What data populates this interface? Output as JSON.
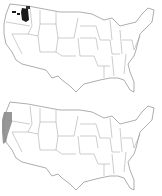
{
  "figure": {
    "panels": [
      {
        "id": "top",
        "description": "US state map with dark shaded region in eastern Washington / northern Idaho",
        "highlight_color": "#1a1a1a",
        "highlighted_regions": [
          "eastern-washington",
          "northern-idaho-panhandle"
        ]
      },
      {
        "id": "bottom",
        "description": "US state map with gray shaded region along Pacific coast (Oregon / northern California)",
        "highlight_color": "#8c8c8c",
        "highlighted_regions": [
          "oregon-coast",
          "northern-california-coast"
        ]
      }
    ],
    "colors": {
      "background": "#ffffff",
      "state_borders": "#9a9a9a",
      "top_highlight": "#1a1a1a",
      "bottom_highlight": "#8c8c8c"
    }
  }
}
